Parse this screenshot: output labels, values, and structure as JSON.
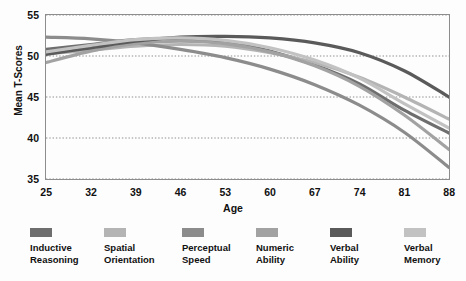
{
  "chart_data": {
    "type": "line",
    "title": "",
    "xlabel": "Age",
    "ylabel": "Mean T-Scores",
    "xlim": [
      25,
      88
    ],
    "ylim": [
      35,
      55
    ],
    "grid": true,
    "grid_axis": "y",
    "legend_position": "bottom",
    "xticks": [
      25,
      32,
      39,
      46,
      53,
      60,
      67,
      74,
      81,
      88
    ],
    "yticks": [
      35,
      40,
      45,
      50,
      55
    ],
    "x": [
      25,
      32,
      39,
      46,
      53,
      60,
      67,
      74,
      81,
      88
    ],
    "series": [
      {
        "name": "Inductive Reasoning",
        "color": "#6e6e6e",
        "values": [
          50.8,
          51.4,
          52.0,
          52.1,
          51.7,
          50.6,
          48.9,
          46.6,
          43.4,
          40.6
        ]
      },
      {
        "name": "Spatial Orientation",
        "color": "#b4b4b4",
        "values": [
          50.3,
          50.7,
          51.2,
          51.4,
          51.2,
          50.4,
          49.2,
          47.4,
          45.0,
          42.3
        ]
      },
      {
        "name": "Perceptual Speed",
        "color": "#8c8c8c",
        "values": [
          52.3,
          52.1,
          51.6,
          50.8,
          49.8,
          48.4,
          46.5,
          44.0,
          40.7,
          36.4
        ]
      },
      {
        "name": "Numeric Ability",
        "color": "#a2a2a2",
        "values": [
          49.2,
          50.6,
          51.5,
          51.8,
          51.5,
          50.5,
          48.8,
          46.3,
          42.8,
          38.6
        ]
      },
      {
        "name": "Verbal Ability",
        "color": "#5a5a5a",
        "values": [
          50.2,
          51.0,
          51.8,
          52.3,
          52.4,
          52.2,
          51.6,
          50.4,
          48.2,
          45.0
        ]
      },
      {
        "name": "Verbal Memory",
        "color": "#c2c2c2",
        "values": [
          50.5,
          51.3,
          52.0,
          52.2,
          51.9,
          51.0,
          49.5,
          47.3,
          44.2,
          41.2
        ]
      }
    ]
  },
  "axis": {
    "y_title": "Mean T-Scores",
    "x_title": "Age",
    "yticks": [
      "55",
      "50",
      "45",
      "40",
      "35"
    ],
    "xticks": [
      "25",
      "32",
      "39",
      "46",
      "53",
      "60",
      "67",
      "74",
      "81",
      "88"
    ]
  },
  "legend": {
    "items": [
      {
        "line1": "Inductive",
        "line2": "Reasoning",
        "color": "#6e6e6e"
      },
      {
        "line1": "Spatial",
        "line2": "Orientation",
        "color": "#b4b4b4"
      },
      {
        "line1": "Perceptual",
        "line2": "Speed",
        "color": "#8c8c8c"
      },
      {
        "line1": "Numeric",
        "line2": "Ability",
        "color": "#a2a2a2"
      },
      {
        "line1": "Verbal",
        "line2": "Ability",
        "color": "#5a5a5a"
      },
      {
        "line1": "Verbal",
        "line2": "Memory",
        "color": "#c2c2c2"
      }
    ]
  },
  "style": {
    "grid_color": "#8d8d8d",
    "frame_color": "#8d8d8d",
    "background": "#fdfdfd",
    "text_color": "#111111"
  }
}
